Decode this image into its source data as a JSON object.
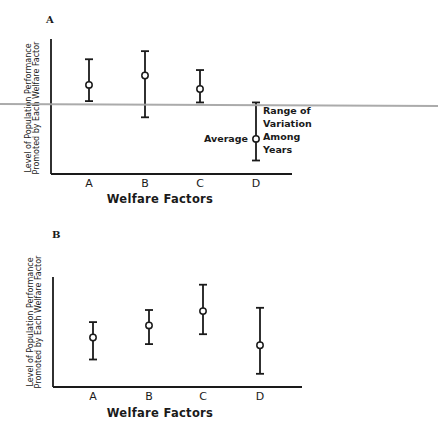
{
  "chart_data": [
    {
      "panel": "A",
      "type": "scatter",
      "subtype": "error-bar (mean with range)",
      "title": "A",
      "xlabel": "Welfare Factors",
      "ylabel": "Level of Population Performance Promoted by Each Welfare Factor",
      "ylabel_lines": [
        "Level of Population Performance",
        "Promoted by Each Welfare Factor"
      ],
      "categories": [
        "A",
        "B",
        "C",
        "D"
      ],
      "series": [
        {
          "name": "Average",
          "values": [
            66,
            73,
            63,
            26
          ]
        },
        {
          "name": "Range max",
          "values": [
            85,
            91,
            77,
            53
          ]
        },
        {
          "name": "Range min",
          "values": [
            54,
            42,
            53,
            10
          ]
        }
      ],
      "ylim": [
        0,
        100
      ],
      "y_ticks_shown": false,
      "grid": false,
      "annotations": [
        {
          "text": "Average",
          "target": "D mean marker",
          "position": "left"
        },
        {
          "text": "Range of Variation Among Years",
          "lines": [
            "Range of",
            "Variation",
            "Among",
            "Years"
          ],
          "target": "D range bar",
          "position": "right"
        }
      ]
    },
    {
      "panel": "B",
      "type": "scatter",
      "subtype": "error-bar (mean with range)",
      "title": "B",
      "xlabel": "Welfare Factors",
      "ylabel": "Level of Population Performance Promoted by Each Welfare Factor",
      "ylabel_lines": [
        "Level of Population Performance",
        "Promoted by Each Welfare Factor"
      ],
      "categories": [
        "A",
        "B",
        "C",
        "D"
      ],
      "series": [
        {
          "name": "Average",
          "values": [
            45,
            56,
            69,
            38
          ]
        },
        {
          "name": "Range max",
          "values": [
            59,
            70,
            93,
            72
          ]
        },
        {
          "name": "Range min",
          "values": [
            25,
            39,
            48,
            12
          ]
        }
      ],
      "ylim": [
        0,
        100
      ],
      "y_ticks_shown": false,
      "grid": false
    }
  ],
  "colors": {
    "ink": "#1a1a1a",
    "background": "#ffffff",
    "scan_line": "#a3a3a3"
  }
}
